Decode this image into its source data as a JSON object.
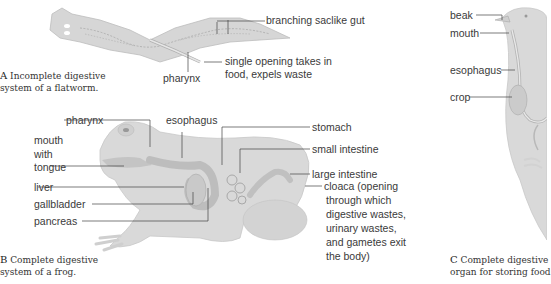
{
  "panels": {
    "a": {
      "caption_letter": "A",
      "caption_line1": "Incomplete digestive",
      "caption_line2": "system of a flatworm.",
      "labels": {
        "gut": "branching saclike gut",
        "pharynx": "pharynx",
        "opening_line1": "single opening takes in",
        "opening_line2": "food, expels waste"
      }
    },
    "b": {
      "caption_letter": "B",
      "caption_line1": "Complete digestive",
      "caption_line2": "system of a frog.",
      "labels": {
        "pharynx": "pharynx",
        "esophagus": "esophagus",
        "mouth1": "mouth",
        "mouth2": "with",
        "mouth3": "tongue",
        "liver": "liver",
        "gallbladder": "gallbladder",
        "pancreas": "pancreas",
        "stomach": "stomach",
        "small_intestine": "small intestine",
        "large_intestine": "large intestine",
        "cloaca1": "cloaca (opening",
        "cloaca2": "through which",
        "cloaca3": "digestive wastes,",
        "cloaca4": "urinary wastes,",
        "cloaca5": "and gametes exit",
        "cloaca6": "the body)"
      }
    },
    "c": {
      "caption_letter": "C",
      "caption_line1": "Complete digestive",
      "caption_line2": "organ for storing food",
      "labels": {
        "beak": "beak",
        "mouth": "mouth",
        "esophagus": "esophagus",
        "crop": "crop"
      }
    }
  },
  "colors": {
    "body": "#d9d9d9",
    "organ": "#c4c4c4",
    "line": "#555555",
    "text": "#3a3a3a"
  }
}
